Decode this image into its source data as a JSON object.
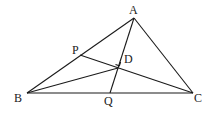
{
  "diagram": {
    "type": "geometry",
    "points": {
      "A": {
        "label": "A",
        "x": 134,
        "y": 18,
        "lx": 130,
        "ly": 13
      },
      "B": {
        "label": "B",
        "x": 27,
        "y": 93,
        "lx": 15,
        "ly": 102
      },
      "C": {
        "label": "C",
        "x": 193,
        "y": 93,
        "lx": 195,
        "ly": 102
      },
      "P": {
        "label": "P",
        "x": 80,
        "y": 55,
        "lx": 73,
        "ly": 54
      },
      "D": {
        "label": "D",
        "x": 118,
        "y": 68,
        "lx": 124,
        "ly": 62
      },
      "Q": {
        "label": "Q",
        "x": 110,
        "y": 93,
        "lx": 105,
        "ly": 104
      }
    },
    "segments": [
      [
        "A",
        "B"
      ],
      [
        "A",
        "C"
      ],
      [
        "B",
        "C"
      ],
      [
        "A",
        "Q"
      ],
      [
        "P",
        "C"
      ],
      [
        "B",
        "D"
      ]
    ],
    "right_angle_at": "D"
  }
}
